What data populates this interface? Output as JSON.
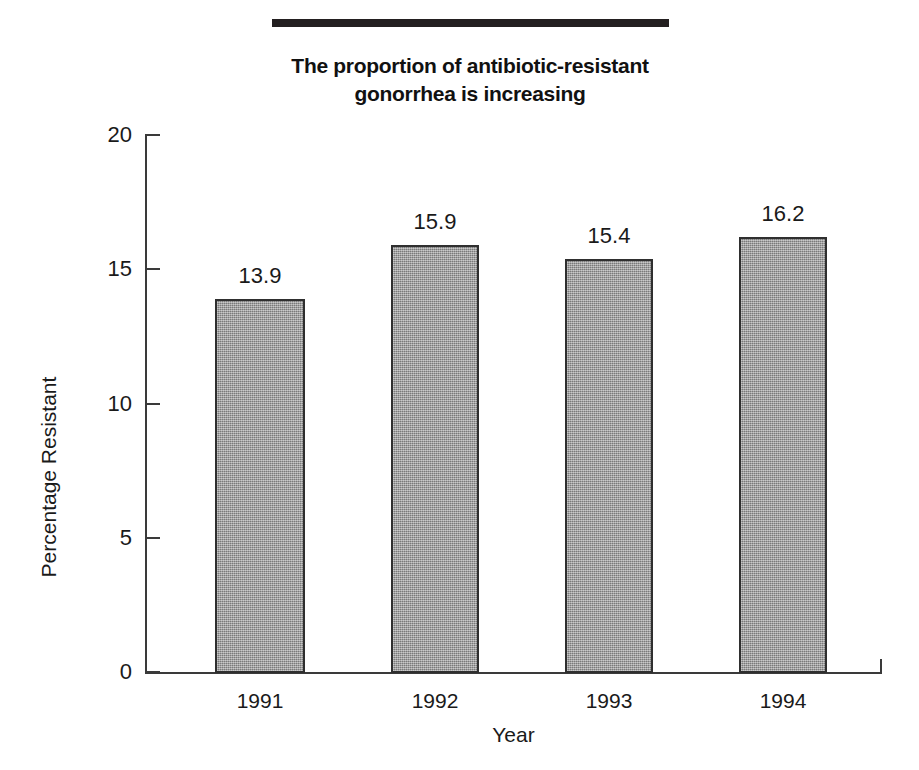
{
  "figure": {
    "title_lines": [
      "The proportion of antibiotic-resistant",
      "gonorrhea is increasing"
    ],
    "title_rule": "horizontal-rule",
    "colors": {
      "bar_fill": "#9b9b9b",
      "bar_outline": "#2f2f2f",
      "axis": "#3a3a3a",
      "text": "#1a1a1a",
      "title_rule": "#231f20",
      "background": "#ffffff"
    }
  },
  "chart_data": {
    "type": "bar",
    "xlabel": "Year",
    "ylabel": "Percentage Resistant",
    "categories": [
      "1991",
      "1992",
      "1993",
      "1994"
    ],
    "values": [
      13.9,
      15.9,
      15.4,
      16.2
    ],
    "value_labels": [
      "13.9",
      "15.9",
      "15.4",
      "16.2"
    ],
    "ylim": [
      0,
      20
    ],
    "yticks": [
      0,
      5,
      10,
      15,
      20
    ],
    "ytick_labels": [
      "0",
      "5",
      "10",
      "15",
      "20"
    ],
    "grid": false,
    "legend": false,
    "data_labels": true,
    "bar_count": 4,
    "series": [
      {
        "name": "Percentage Resistant",
        "values": [
          13.9,
          15.9,
          15.4,
          16.2
        ]
      }
    ]
  }
}
